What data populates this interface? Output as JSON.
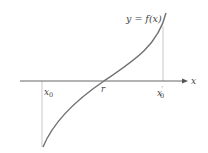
{
  "diagram": {
    "curve_label": "y = f(x)",
    "axis_label": "x",
    "points": {
      "x0": "x0",
      "root": "r",
      "x0_prime": "x'0"
    },
    "colors": {
      "curve": "#707070",
      "axis": "#555555",
      "guides": "#bbbbbb",
      "text": "#444444"
    }
  }
}
